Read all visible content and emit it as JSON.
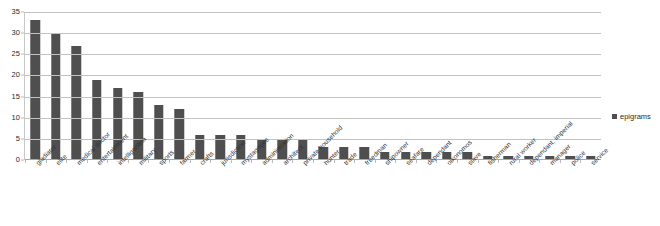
{
  "chart_data": {
    "type": "bar",
    "title": "",
    "xlabel": "",
    "ylabel": "",
    "ylim": [
      0,
      35
    ],
    "ytick_step": 5,
    "yticks": [
      0,
      5,
      10,
      15,
      20,
      25,
      30,
      35
    ],
    "grid": true,
    "legend_position": "right",
    "series_name": "epigrams",
    "bar_color": "#4f4f4f",
    "gridline_color": "#c2c2c2",
    "categories": [
      "gladiator",
      "elite",
      "medical doctor",
      "entertainment",
      "intelligentsia",
      "military",
      "sports",
      "farmer",
      "crafts",
      "jurisdiction",
      "mystagoges",
      "administration",
      "architect",
      "private household",
      "hunter",
      "trade",
      "freedman",
      "shipowner",
      "seafare",
      "dependant",
      "oikonomos",
      "slave",
      "fisherman",
      "rural worker",
      "dependant, imperial",
      "manager",
      "police",
      "service"
    ],
    "values": [
      33,
      30,
      27,
      19,
      17,
      16,
      13,
      12,
      6,
      6,
      6,
      5,
      5,
      5,
      3,
      3,
      3,
      2,
      2,
      2,
      2,
      2,
      1,
      1,
      1,
      1,
      1,
      1
    ]
  },
  "legend": {
    "entries": [
      {
        "label": "epigrams",
        "color": "#4f4f4f"
      }
    ]
  }
}
